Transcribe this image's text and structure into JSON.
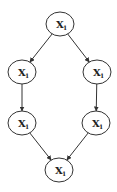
{
  "diagram": {
    "type": "directed-graph",
    "colors": {
      "stroke": "#333333",
      "fill": "#ffffff",
      "text": "#222222"
    },
    "nodes": [
      {
        "id": "top",
        "label": "X",
        "subscript": "1",
        "cx": 60,
        "cy": 24,
        "rx": 14,
        "ry": 12
      },
      {
        "id": "left-mid",
        "label": "X",
        "subscript": "1",
        "cx": 22,
        "cy": 72,
        "rx": 14,
        "ry": 12
      },
      {
        "id": "right-mid",
        "label": "X",
        "subscript": "1",
        "cx": 97,
        "cy": 72,
        "rx": 14,
        "ry": 12
      },
      {
        "id": "left-lower",
        "label": "X",
        "subscript": "1",
        "cx": 22,
        "cy": 123,
        "rx": 14,
        "ry": 12
      },
      {
        "id": "right-lower",
        "label": "X",
        "subscript": "1",
        "cx": 96,
        "cy": 123,
        "rx": 14,
        "ry": 12
      },
      {
        "id": "bottom",
        "label": "X",
        "subscript": "1",
        "cx": 59,
        "cy": 170,
        "rx": 14,
        "ry": 12
      }
    ],
    "edges": [
      {
        "from": "top",
        "to": "left-mid"
      },
      {
        "from": "top",
        "to": "right-mid"
      },
      {
        "from": "left-mid",
        "to": "left-lower"
      },
      {
        "from": "right-mid",
        "to": "right-lower"
      },
      {
        "from": "left-lower",
        "to": "bottom"
      },
      {
        "from": "right-lower",
        "to": "bottom"
      }
    ]
  }
}
